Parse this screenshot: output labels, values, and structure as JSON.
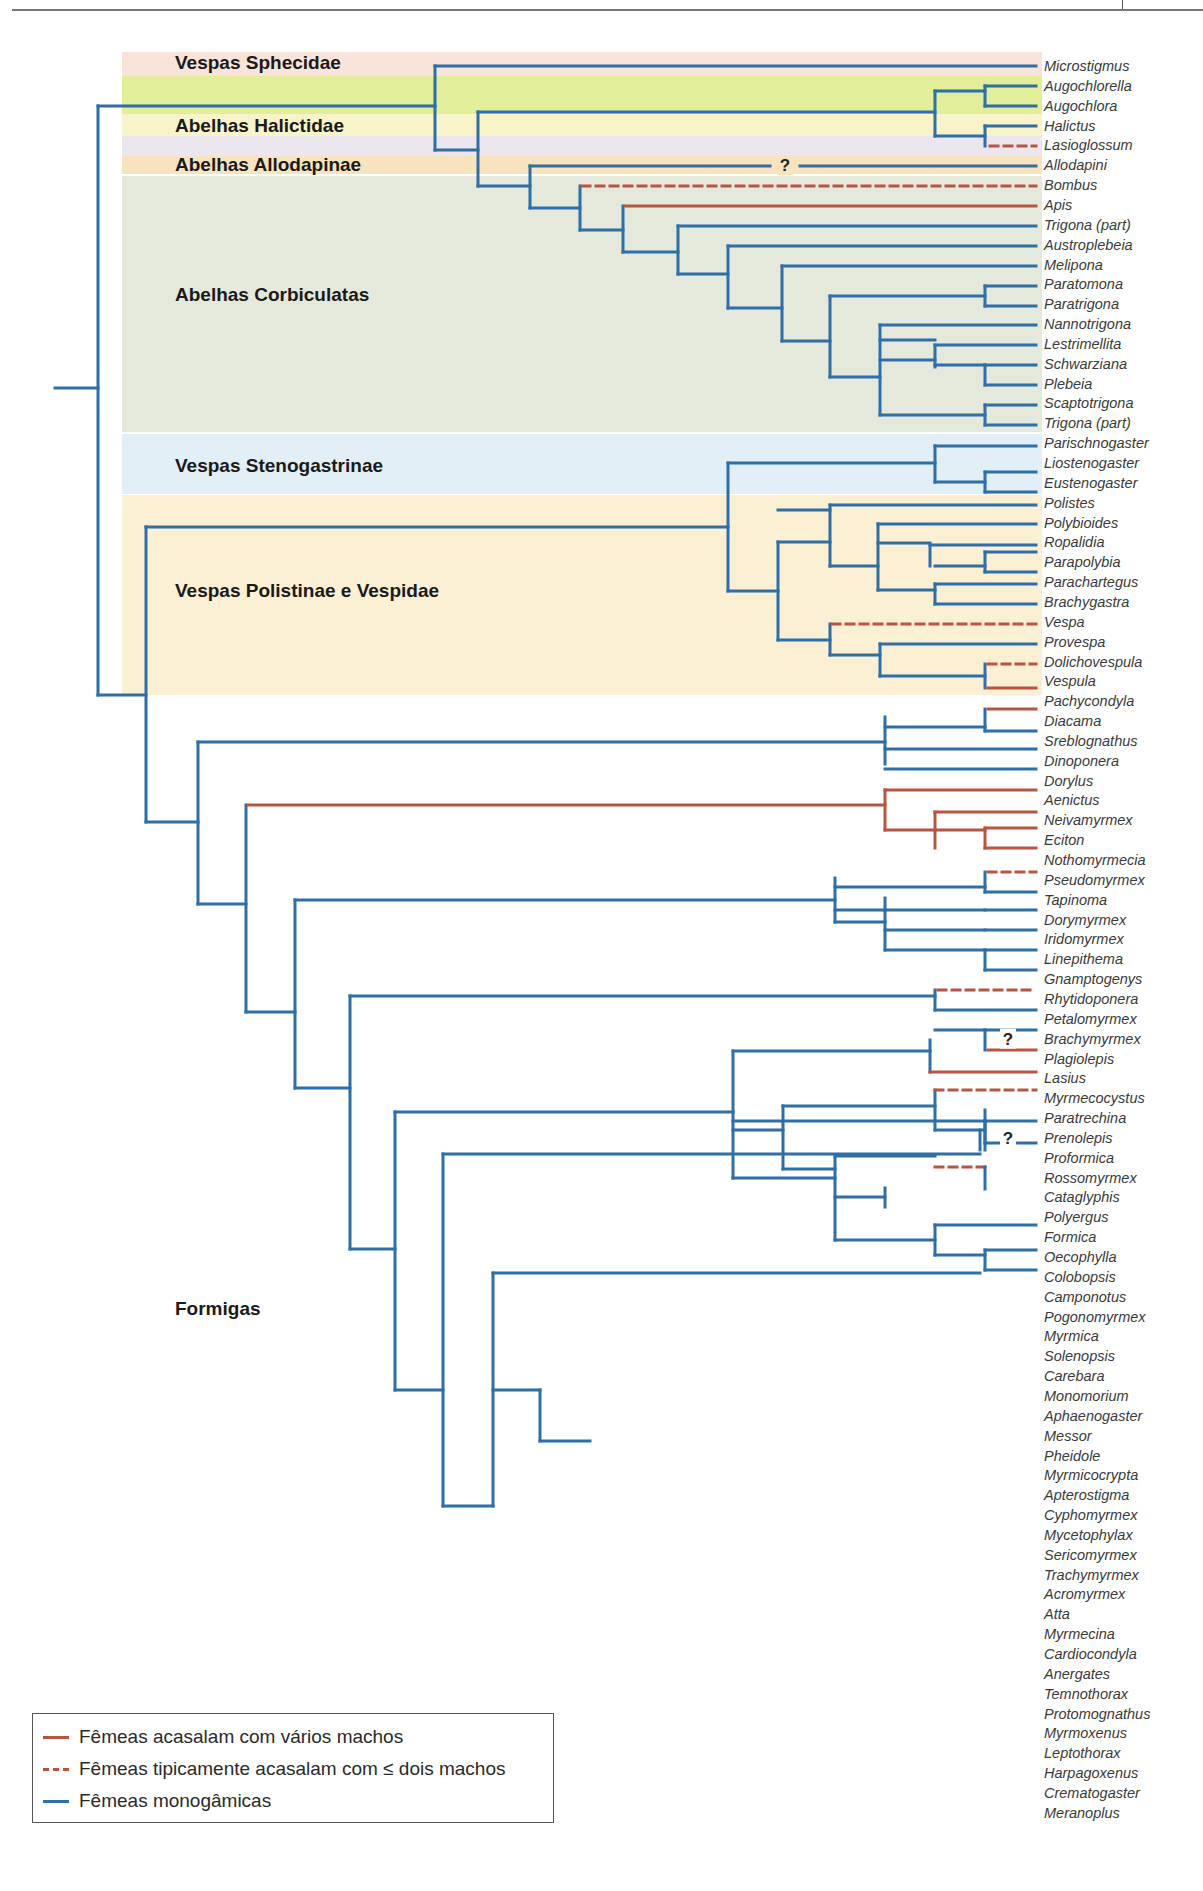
{
  "header": {
    "divider": true
  },
  "colors": {
    "monogamous": "#2f6fa8",
    "multiple": "#b85440",
    "le_two": "#b85440"
  },
  "groups": [
    {
      "label": "Vespas Sphecidae",
      "top": 52,
      "height": 24,
      "color": "#f8e4da",
      "label_y": 52
    },
    {
      "label": "",
      "top": 76,
      "height": 38,
      "color": "#e3ee9a",
      "label_y": 0
    },
    {
      "label": "Abelhas Halictidae",
      "top": 114,
      "height": 22,
      "color": "#f8f3c9",
      "label_y": 115
    },
    {
      "label": "",
      "top": 136,
      "height": 20,
      "color": "#ece6ef",
      "label_y": 0
    },
    {
      "label": "Abelhas Allodapinae",
      "top": 156,
      "height": 18,
      "color": "#f7e4bf",
      "label_y": 154
    },
    {
      "label": "Abelhas Corbiculatas",
      "top": 176,
      "height": 256,
      "color": "#e5e9dc",
      "label_y": 284
    },
    {
      "label": "Vespas Stenogastrinae",
      "top": 434,
      "height": 60,
      "color": "#e3eff7",
      "label_y": 455
    },
    {
      "label": "Vespas Polistinae e Vespidae",
      "top": 495,
      "height": 200,
      "color": "#fbefd4",
      "label_y": 580
    },
    {
      "label": "Formigas",
      "top": 0,
      "height": 0,
      "color": "transparent",
      "label_y": 1298
    }
  ],
  "taxa": [
    "Microstigmus",
    "Augochlorella",
    "Augochlora",
    "Halictus",
    "Lasioglossum",
    "Allodapini",
    "Bombus",
    "Apis",
    "Trigona (part)",
    "Austroplebeia",
    "Melipona",
    "Paratomona",
    "Paratrigona",
    "Nannotrigona",
    "Lestrimellita",
    "Schwarziana",
    "Plebeia",
    "Scaptotrigona",
    "Trigona (part)",
    "Parischnogaster",
    "Liostenogaster",
    "Eustenogaster",
    "Polistes",
    "Polybioides",
    "Ropalidia",
    "Parapolybia",
    "Parachartegus",
    "Brachygastra",
    "Vespa",
    "Provespa",
    "Dolichovespula",
    "Vespula",
    "Pachycondyla",
    "Diacama",
    "Sreblognathus",
    "Dinoponera",
    "Dorylus",
    "Aenictus",
    "Neivamyrmex",
    "Eciton",
    "Nothomyrmecia",
    "Pseudomyrmex",
    "Tapinoma",
    "Dorymyrmex",
    "Iridomyrmex",
    "Linepithema",
    "Gnamptogenys",
    "Rhytidoponera",
    "Petalomyrmex",
    "Brachymyrmex",
    "Plagiolepis",
    "Lasius",
    "Myrmecocystus",
    "Paratrechina",
    "Prenolepis",
    "Proformica",
    "Rossomyrmex",
    "Cataglyphis",
    "Polyergus",
    "Formica",
    "Oecophylla",
    "Colobopsis",
    "Camponotus",
    "Pogonomyrmex",
    "Myrmica",
    "Solenopsis",
    "Carebara",
    "Monomorium",
    "Aphaenogaster",
    "Messor",
    "Pheidole",
    "Myrmicocrypta",
    "Apterostigma",
    "Cyphomyrmex",
    "Mycetophylax",
    "Sericomyrmex",
    "Trachymyrmex",
    "Acromyrmex",
    "Atta",
    "Myrmecina",
    "Cardiocondyla",
    "Anergates",
    "Temnothorax",
    "Protomognathus",
    "Myrmoxenus",
    "Leptothorax",
    "Harpagoxenus",
    "Crematogaster",
    "Meranoplus"
  ],
  "layout": {
    "row0_y": 66,
    "row_step": 19.85,
    "tip_x": 1036
  },
  "question_marks": [
    {
      "x": 785,
      "row": 5,
      "text": "?"
    },
    {
      "x": 1008,
      "row": 49,
      "text": "?"
    },
    {
      "x": 1008,
      "row": 54,
      "text": "?"
    }
  ],
  "chart_data": {
    "type": "phylogenetic_tree",
    "title": "",
    "legend": [
      {
        "label": "Fêmeas acasalam com vários machos",
        "style": "solid",
        "color": "#b85440"
      },
      {
        "label": "Fêmeas tipicamente acasalam com ≤ dois machos",
        "style": "dashed",
        "color": "#b85440"
      },
      {
        "label": "Fêmeas monogâmicas",
        "style": "solid",
        "color": "#2f6fa8"
      }
    ],
    "tip_states": {
      "multiple": [
        "Apis",
        "Vespula",
        "Pachycondyla",
        "Dorylus",
        "Aenictus",
        "Neivamyrmex",
        "Eciton",
        "Plagiolepis",
        "Cataglyphis",
        "Pogonomyrmex",
        "Acromyrmex",
        "Atta",
        "Cardiocondyla"
      ],
      "le_two": [
        "Lasioglossum",
        "Bombus",
        "Vespa",
        "Dolichovespula",
        "Nothomyrmecia",
        "Gnamptogenys",
        "Lasius",
        "Myrmecocystus",
        "Proformica",
        "Formica",
        "Myrmica",
        "Carebara",
        "Messor",
        "Anergates"
      ],
      "uncertain": [
        "Allodapini",
        "Brachymyrmex",
        "Prenolepis"
      ]
    }
  },
  "legend": {
    "items": [
      {
        "label": "Fêmeas acasalam com vários machos"
      },
      {
        "label": "Fêmeas tipicamente acasalam com ≤ dois machos"
      },
      {
        "label": "Fêmeas monogâmicas"
      }
    ]
  },
  "segments": [
    [
      55,
      388,
      98,
      388,
      "b"
    ],
    [
      98,
      106,
      98,
      695,
      "b"
    ],
    [
      98,
      106,
      435,
      106,
      "b"
    ],
    [
      98,
      695,
      146,
      695,
      "b"
    ],
    [
      435,
      66,
      435,
      150,
      "b"
    ],
    [
      435,
      66,
      1036,
      66,
      "b"
    ],
    [
      435,
      150,
      478,
      150,
      "b"
    ],
    [
      478,
      112,
      478,
      186,
      "b"
    ],
    [
      478,
      112,
      935,
      112,
      "b"
    ],
    [
      935,
      91,
      935,
      136,
      "b"
    ],
    [
      935,
      91,
      985,
      91,
      "b"
    ],
    [
      985,
      86,
      985,
      106,
      "b"
    ],
    [
      985,
      86,
      1036,
      86,
      "b"
    ],
    [
      985,
      106,
      1036,
      106,
      "b"
    ],
    [
      935,
      136,
      985,
      136,
      "b"
    ],
    [
      985,
      126,
      985,
      146,
      "b"
    ],
    [
      985,
      126,
      1036,
      126,
      "b"
    ],
    [
      990,
      146,
      1036,
      146,
      "r-"
    ],
    [
      478,
      186,
      530,
      186,
      "b"
    ],
    [
      530,
      166,
      530,
      208,
      "b"
    ],
    [
      530,
      166,
      770,
      166,
      "b"
    ],
    [
      800,
      166,
      1036,
      166,
      "b"
    ],
    [
      530,
      208,
      580,
      208,
      "b"
    ],
    [
      580,
      186,
      580,
      230,
      "b"
    ],
    [
      582,
      186,
      1036,
      186,
      "r-"
    ],
    [
      580,
      230,
      623,
      230,
      "b"
    ],
    [
      623,
      206,
      623,
      252,
      "b"
    ],
    [
      625,
      206,
      1036,
      206,
      "r"
    ],
    [
      623,
      252,
      678,
      252,
      "b"
    ],
    [
      678,
      226,
      678,
      274,
      "b"
    ],
    [
      678,
      226,
      1036,
      226,
      "b"
    ],
    [
      678,
      274,
      728,
      274,
      "b"
    ],
    [
      728,
      246,
      728,
      308,
      "b"
    ],
    [
      728,
      246,
      1036,
      246,
      "b"
    ],
    [
      728,
      308,
      782,
      308,
      "b"
    ],
    [
      782,
      266,
      782,
      341,
      "b"
    ],
    [
      782,
      266,
      1036,
      266,
      "b"
    ],
    [
      782,
      341,
      830,
      341,
      "b"
    ],
    [
      830,
      296,
      830,
      377,
      "b"
    ],
    [
      830,
      296,
      985,
      296,
      "b"
    ],
    [
      985,
      286,
      985,
      306,
      "b"
    ],
    [
      985,
      286,
      1036,
      286,
      "b"
    ],
    [
      985,
      306,
      1036,
      306,
      "b"
    ],
    [
      830,
      377,
      880,
      377,
      "b"
    ],
    [
      880,
      325,
      880,
      415,
      "b"
    ],
    [
      880,
      325,
      1036,
      325,
      "b"
    ],
    [
      880,
      340,
      935,
      340,
      "b"
    ],
    [
      935,
      345,
      935,
      367,
      "b"
    ],
    [
      880,
      360,
      935,
      360,
      "b"
    ],
    [
      935,
      345,
      1036,
      345,
      "b"
    ],
    [
      935,
      365,
      985,
      365,
      "b"
    ],
    [
      985,
      365,
      985,
      385,
      "b"
    ],
    [
      985,
      365,
      1036,
      365,
      "b"
    ],
    [
      985,
      385,
      1036,
      385,
      "b"
    ],
    [
      880,
      415,
      985,
      415,
      "b"
    ],
    [
      985,
      405,
      985,
      425,
      "b"
    ],
    [
      985,
      405,
      1036,
      405,
      "b"
    ],
    [
      985,
      425,
      1036,
      425,
      "b"
    ],
    [
      146,
      527,
      146,
      822,
      "b"
    ],
    [
      146,
      527,
      728,
      527,
      "b"
    ],
    [
      728,
      463,
      728,
      591,
      "b"
    ],
    [
      728,
      463,
      935,
      463,
      "b"
    ],
    [
      935,
      446,
      935,
      482,
      "b"
    ],
    [
      935,
      446,
      1036,
      446,
      "b"
    ],
    [
      935,
      482,
      985,
      482,
      "b"
    ],
    [
      985,
      472,
      985,
      492,
      "b"
    ],
    [
      985,
      472,
      1036,
      472,
      "b"
    ],
    [
      985,
      492,
      1036,
      492,
      "b"
    ],
    [
      728,
      591,
      778,
      591,
      "b"
    ],
    [
      778,
      542,
      778,
      640,
      "b"
    ],
    [
      778,
      510,
      830,
      510,
      "b"
    ],
    [
      830,
      505,
      830,
      566,
      "b"
    ],
    [
      830,
      505,
      1036,
      505,
      "b"
    ],
    [
      778,
      542,
      830,
      542,
      "b"
    ],
    [
      830,
      566,
      878,
      566,
      "b"
    ],
    [
      878,
      524,
      878,
      590,
      "b"
    ],
    [
      878,
      524,
      1036,
      524,
      "b"
    ],
    [
      878,
      543,
      930,
      543,
      "b"
    ],
    [
      930,
      545,
      930,
      566,
      "b"
    ],
    [
      930,
      545,
      1036,
      545,
      "b"
    ],
    [
      935,
      566,
      985,
      566,
      "b"
    ],
    [
      985,
      552,
      985,
      572,
      "b"
    ],
    [
      985,
      552,
      1036,
      552,
      "b"
    ],
    [
      985,
      572,
      1036,
      572,
      "b"
    ],
    [
      878,
      590,
      935,
      590,
      "b"
    ],
    [
      935,
      584,
      935,
      604,
      "b"
    ],
    [
      935,
      584,
      1036,
      584,
      "b"
    ],
    [
      935,
      604,
      1036,
      604,
      "b"
    ],
    [
      778,
      640,
      830,
      640,
      "b"
    ],
    [
      830,
      624,
      830,
      655,
      "b"
    ],
    [
      832,
      624,
      1036,
      624,
      "r-"
    ],
    [
      830,
      655,
      880,
      655,
      "b"
    ],
    [
      880,
      644,
      880,
      676,
      "b"
    ],
    [
      880,
      644,
      1036,
      644,
      "b"
    ],
    [
      880,
      676,
      985,
      676,
      "b"
    ],
    [
      985,
      664,
      985,
      688,
      "b"
    ],
    [
      988,
      664,
      1036,
      664,
      "r-"
    ],
    [
      988,
      688,
      1036,
      688,
      "r"
    ],
    [
      146,
      822,
      198,
      822,
      "b"
    ],
    [
      198,
      742,
      198,
      904,
      "b"
    ],
    [
      198,
      742,
      885,
      742,
      "b"
    ],
    [
      885,
      717,
      885,
      764,
      "b"
    ],
    [
      885,
      727,
      985,
      727,
      "b"
    ],
    [
      985,
      709,
      985,
      731,
      "b"
    ],
    [
      988,
      709,
      1036,
      709,
      "r"
    ],
    [
      985,
      731,
      1036,
      731,
      "b"
    ],
    [
      885,
      749,
      1036,
      749,
      "b"
    ],
    [
      885,
      769,
      1036,
      769,
      "b"
    ],
    [
      198,
      904,
      246,
      904,
      "b"
    ],
    [
      246,
      805,
      246,
      1012,
      "b"
    ],
    [
      248,
      805,
      885,
      805,
      "r"
    ],
    [
      885,
      790,
      885,
      830,
      "r"
    ],
    [
      885,
      790,
      1036,
      790,
      "r"
    ],
    [
      885,
      830,
      935,
      830,
      "r"
    ],
    [
      935,
      812,
      935,
      848,
      "r"
    ],
    [
      935,
      812,
      1036,
      812,
      "r"
    ],
    [
      935,
      830,
      985,
      830,
      "r"
    ],
    [
      985,
      828,
      985,
      848,
      "r"
    ],
    [
      985,
      828,
      1036,
      828,
      "r"
    ],
    [
      985,
      848,
      1036,
      848,
      "r"
    ],
    [
      246,
      1012,
      295,
      1012,
      "b"
    ],
    [
      295,
      900,
      295,
      1088,
      "b"
    ],
    [
      295,
      900,
      835,
      900,
      "b"
    ],
    [
      835,
      878,
      835,
      922,
      "b"
    ],
    [
      835,
      887,
      985,
      887,
      "b"
    ],
    [
      985,
      872,
      985,
      892,
      "b"
    ],
    [
      988,
      872,
      1036,
      872,
      "r-"
    ],
    [
      985,
      892,
      1036,
      892,
      "b"
    ],
    [
      835,
      910,
      885,
      910,
      "b"
    ],
    [
      885,
      898,
      885,
      950,
      "b"
    ],
    [
      885,
      910,
      985,
      910,
      "b"
    ],
    [
      985,
      910,
      1036,
      910,
      "b"
    ],
    [
      885,
      930,
      985,
      930,
      "b"
    ],
    [
      985,
      930,
      1036,
      930,
      "b"
    ],
    [
      835,
      922,
      885,
      922,
      "b"
    ],
    [
      885,
      950,
      985,
      950,
      "b"
    ],
    [
      985,
      950,
      985,
      970,
      "b"
    ],
    [
      985,
      950,
      1036,
      950,
      "b"
    ],
    [
      985,
      970,
      1036,
      970,
      "b"
    ],
    [
      295,
      1088,
      350,
      1088,
      "b"
    ],
    [
      350,
      996,
      350,
      1249,
      "b"
    ],
    [
      350,
      996,
      935,
      996,
      "b"
    ],
    [
      935,
      990,
      935,
      1010,
      "b"
    ],
    [
      938,
      990,
      1036,
      990,
      "r-"
    ],
    [
      935,
      1010,
      1036,
      1010,
      "b"
    ],
    [
      350,
      1249,
      395,
      1249,
      "b"
    ],
    [
      395,
      1112,
      395,
      1390,
      "b"
    ],
    [
      395,
      1112,
      733,
      1112,
      "b"
    ],
    [
      733,
      1051,
      733,
      1178,
      "b"
    ],
    [
      733,
      1051,
      930,
      1051,
      "b"
    ],
    [
      930,
      1040,
      930,
      1072,
      "b"
    ],
    [
      935,
      1030,
      985,
      1030,
      "b"
    ],
    [
      985,
      1030,
      985,
      1050,
      "b"
    ],
    [
      985,
      1030,
      1036,
      1030,
      "b"
    ],
    [
      988,
      1050,
      1036,
      1050,
      "r"
    ],
    [
      930,
      1072,
      1036,
      1072,
      "r"
    ],
    [
      733,
      1121,
      985,
      1121,
      "b"
    ],
    [
      985,
      1121,
      985,
      1143,
      "b"
    ],
    [
      985,
      1121,
      1036,
      1121,
      "b"
    ],
    [
      985,
      1143,
      1036,
      1143,
      "b"
    ],
    [
      733,
      1130,
      783,
      1130,
      "b"
    ],
    [
      783,
      1106,
      783,
      1169,
      "b"
    ],
    [
      783,
      1106,
      935,
      1106,
      "b"
    ],
    [
      935,
      1090,
      935,
      1130,
      "b"
    ],
    [
      935,
      1090,
      1036,
      1090,
      "r-"
    ],
    [
      935,
      1130,
      985,
      1130,
      "b"
    ],
    [
      985,
      1110,
      985,
      1150,
      "b"
    ],
    [
      783,
      1169,
      835,
      1169,
      "b"
    ],
    [
      835,
      1156,
      835,
      1240,
      "b"
    ],
    [
      835,
      1156,
      935,
      1156,
      "b"
    ],
    [
      935,
      1167,
      985,
      1167,
      "r-"
    ],
    [
      985,
      1167,
      985,
      1189,
      "b"
    ],
    [
      835,
      1197,
      885,
      1197,
      "b"
    ],
    [
      885,
      1188,
      885,
      1207,
      "b"
    ],
    [
      733,
      1178,
      835,
      1178,
      "b"
    ],
    [
      835,
      1240,
      935,
      1240,
      "b"
    ],
    [
      935,
      1225,
      935,
      1255,
      "b"
    ],
    [
      935,
      1225,
      1036,
      1225,
      "b"
    ],
    [
      935,
      1255,
      985,
      1255,
      "b"
    ],
    [
      985,
      1250,
      985,
      1270,
      "b"
    ],
    [
      985,
      1250,
      1036,
      1250,
      "b"
    ],
    [
      985,
      1270,
      1036,
      1270,
      "b"
    ],
    [
      395,
      1390,
      443,
      1390,
      "b"
    ],
    [
      443,
      1154,
      443,
      1506,
      "b"
    ],
    [
      443,
      1154,
      980,
      1154,
      "b"
    ],
    [
      980,
      1130,
      980,
      1150,
      "b"
    ],
    [
      443,
      1506,
      493,
      1506,
      "b"
    ],
    [
      493,
      1273,
      493,
      1506,
      "b"
    ],
    [
      493,
      1390,
      540,
      1390,
      "b"
    ],
    [
      540,
      1390,
      540,
      1441,
      "b"
    ],
    [
      493,
      1273,
      980,
      1273,
      "b"
    ],
    [
      540,
      1441,
      590,
      1441,
      "b"
    ]
  ]
}
